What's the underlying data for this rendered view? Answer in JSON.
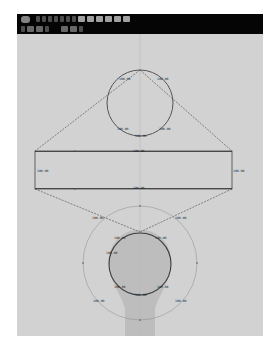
{
  "toolbar": {
    "row1": [
      {
        "icon": "refresh-icon"
      },
      {
        "icon": "pointer-icon"
      },
      {
        "icon": "node-tool-icon"
      },
      {
        "icon": "line-tool-icon"
      },
      {
        "icon": "arc-tool-icon"
      },
      {
        "icon": "curve-tool-icon"
      },
      {
        "icon": "pen-tool-icon"
      },
      {
        "icon": "shape-tool-icon"
      },
      {
        "icon": "fill-icon"
      },
      {
        "icon": "gradient-icon"
      },
      {
        "icon": "grid-icon"
      },
      {
        "icon": "align-icon"
      },
      {
        "icon": "distribute-icon"
      },
      {
        "icon": "snap-icon"
      }
    ],
    "row2": [
      {
        "icon": "select-icon"
      },
      {
        "icon": "layer-icon"
      },
      {
        "icon": "group-icon"
      },
      {
        "icon": "undo-icon"
      },
      {
        "icon": "transform-icon"
      },
      {
        "icon": "measure-icon"
      },
      {
        "icon": "redo-icon"
      }
    ]
  },
  "diagram": {
    "colors": {
      "canvas": "#d2d2d2",
      "stroke": "#555555",
      "guide": "#b9b9b9",
      "bulb": "#bdbdbd"
    },
    "top_circle_labels": [
      "100.00",
      "100.00",
      "100.00",
      "100.00",
      "100.00"
    ],
    "rect_labels": {
      "top": "100.00",
      "bottom": "100.00",
      "left": "100.00",
      "right": "100.00"
    },
    "bottom_outer_labels": [
      "100.00",
      "100.00",
      "100.00",
      "100.00"
    ],
    "bottom_inner_labels": [
      "100.00",
      "100.00",
      "100.00",
      "100.00",
      "100.00",
      "100.00"
    ]
  }
}
